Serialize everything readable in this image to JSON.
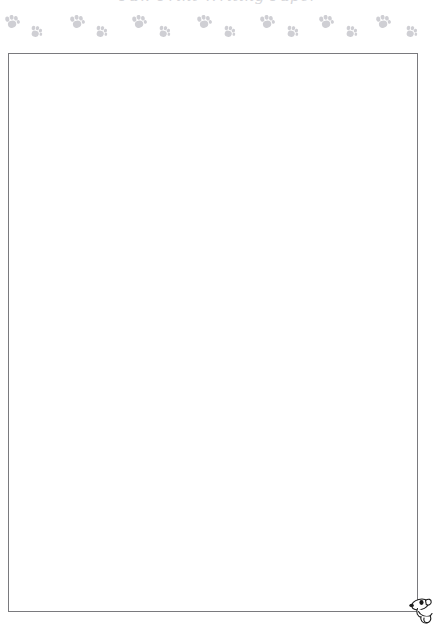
{
  "page": {
    "title_cut_off": "Paw Print Writing Paper",
    "background_color": "#ffffff",
    "width": 437,
    "height": 628
  },
  "decoration": {
    "border_name": "paw-print-border",
    "paw_color": "#cfcfd4",
    "paw_count": 16,
    "paws": [
      {
        "x": 4,
        "y": 3,
        "size": "large",
        "rotation": -12
      },
      {
        "x": 29,
        "y": 14,
        "size": "small",
        "rotation": 14
      },
      {
        "x": 69,
        "y": 3,
        "size": "large",
        "rotation": -12
      },
      {
        "x": 94,
        "y": 14,
        "size": "small",
        "rotation": 14
      },
      {
        "x": 131,
        "y": 3,
        "size": "large",
        "rotation": -12
      },
      {
        "x": 157,
        "y": 14,
        "size": "small",
        "rotation": 14
      },
      {
        "x": 196,
        "y": 3,
        "size": "large",
        "rotation": -12
      },
      {
        "x": 222,
        "y": 14,
        "size": "small",
        "rotation": 14
      },
      {
        "x": 259,
        "y": 3,
        "size": "large",
        "rotation": -12
      },
      {
        "x": 285,
        "y": 14,
        "size": "small",
        "rotation": 14
      },
      {
        "x": 318,
        "y": 3,
        "size": "large",
        "rotation": -12
      },
      {
        "x": 344,
        "y": 14,
        "size": "small",
        "rotation": 14
      },
      {
        "x": 375,
        "y": 3,
        "size": "large",
        "rotation": -12
      },
      {
        "x": 404,
        "y": 14,
        "size": "small",
        "rotation": 14
      },
      {
        "x": 231,
        "y": 3,
        "size": "large",
        "rotation": -12
      },
      {
        "x": 167,
        "y": 14,
        "size": "small",
        "rotation": 14
      }
    ]
  },
  "writing_box": {
    "name": "writing-area",
    "content": "",
    "placeholder": "",
    "border_color": "#7a7a7e",
    "x": 8,
    "y": 53,
    "width": 410,
    "height": 559
  },
  "mascot": {
    "name": "cartoon-dog",
    "description": "puppy peeking over corner",
    "outline_color": "#1a1a1a",
    "fill_color": "#ffffff"
  }
}
